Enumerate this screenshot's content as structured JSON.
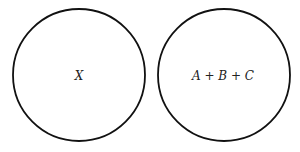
{
  "diagram": {
    "circles": [
      {
        "label": "X"
      },
      {
        "label": "A + B + C"
      }
    ]
  }
}
